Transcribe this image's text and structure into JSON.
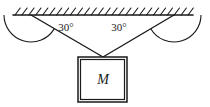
{
  "figure": {
    "kind": "physics-free-body-diagram",
    "background_color": "#ffffff",
    "stroke_color": "#1a1a1a"
  },
  "ceiling": {
    "name": "ceiling",
    "hatch_count": 26,
    "line_x_start": 13,
    "line_x_end": 193,
    "line_y": 15
  },
  "strings": {
    "left": {
      "label": "left-string",
      "anchor_x": 31,
      "anchor_y": 15,
      "end_x": 103,
      "end_y": 57
    },
    "right": {
      "label": "right-string",
      "anchor_x": 174,
      "anchor_y": 15,
      "end_x": 103,
      "end_y": 57
    }
  },
  "angles": {
    "left": {
      "value": "30°",
      "label_x": 66,
      "label_y": 31
    },
    "right": {
      "value": "30°",
      "label_x": 119,
      "label_y": 31
    }
  },
  "block": {
    "label": "M",
    "x": 78,
    "y": 57,
    "width": 49,
    "height": 45,
    "label_x": 103,
    "label_y": 84
  }
}
